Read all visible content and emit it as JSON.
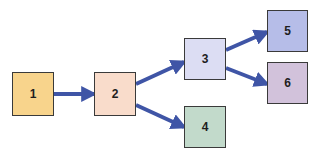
{
  "diagram": {
    "type": "flow",
    "arrow_color": "#3f55a6",
    "nodes": [
      {
        "id": "1",
        "label": "1",
        "x": 12,
        "y": 72,
        "w": 42,
        "h": 44,
        "fill": "#f8d48c"
      },
      {
        "id": "2",
        "label": "2",
        "x": 94,
        "y": 72,
        "w": 42,
        "h": 44,
        "fill": "#f9dccb"
      },
      {
        "id": "3",
        "label": "3",
        "x": 184,
        "y": 38,
        "w": 42,
        "h": 42,
        "fill": "#dcddf3"
      },
      {
        "id": "4",
        "label": "4",
        "x": 184,
        "y": 106,
        "w": 42,
        "h": 42,
        "fill": "#c2dacb"
      },
      {
        "id": "5",
        "label": "5",
        "x": 267,
        "y": 10,
        "w": 41,
        "h": 42,
        "fill": "#b6bde8"
      },
      {
        "id": "6",
        "label": "6",
        "x": 267,
        "y": 62,
        "w": 41,
        "h": 42,
        "fill": "#d2c2db"
      }
    ],
    "edges": [
      {
        "from": "1",
        "to": "2",
        "x1": 54,
        "y1": 94,
        "x2": 94,
        "y2": 94
      },
      {
        "from": "2",
        "to": "3",
        "x1": 136,
        "y1": 84,
        "x2": 184,
        "y2": 62
      },
      {
        "from": "2",
        "to": "4",
        "x1": 136,
        "y1": 105,
        "x2": 184,
        "y2": 127
      },
      {
        "from": "3",
        "to": "5",
        "x1": 226,
        "y1": 50,
        "x2": 267,
        "y2": 32
      },
      {
        "from": "3",
        "to": "6",
        "x1": 226,
        "y1": 68,
        "x2": 267,
        "y2": 84
      }
    ]
  }
}
